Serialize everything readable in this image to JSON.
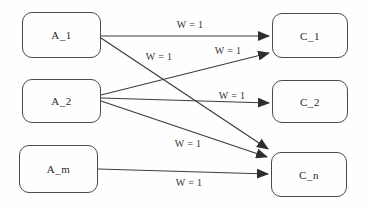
{
  "diagram": {
    "type": "weighted-bipartite-graph",
    "colors": {
      "background": "#fefefe",
      "node_border": "#4a4a4a",
      "edge_line": "#3c3c3c",
      "arrowhead": "#2e2e2e",
      "text": "#2b2b2b"
    },
    "nodes": [
      {
        "id": "A_1",
        "label": "A_1",
        "x": 22,
        "y": 12,
        "w": 79,
        "h": 46
      },
      {
        "id": "A_2",
        "label": "A_2",
        "x": 22,
        "y": 79,
        "w": 79,
        "h": 44
      },
      {
        "id": "A_m",
        "label": "A_m",
        "x": 19,
        "y": 145,
        "w": 79,
        "h": 48
      },
      {
        "id": "C_1",
        "label": "C_1",
        "x": 272,
        "y": 13,
        "w": 76,
        "h": 45
      },
      {
        "id": "C_2",
        "label": "C_2",
        "x": 272,
        "y": 80,
        "w": 76,
        "h": 43
      },
      {
        "id": "C_n",
        "label": "C_n",
        "x": 271,
        "y": 152,
        "w": 76,
        "h": 45
      }
    ],
    "edges": [
      {
        "from": "A_1",
        "to": "C_1",
        "label": "W = 1",
        "x1": 101,
        "y1": 36,
        "x2": 269,
        "y2": 36,
        "lx": 190,
        "ly": 25
      },
      {
        "from": "A_1",
        "to": "C_n",
        "label": "W = 1",
        "x1": 101,
        "y1": 38,
        "x2": 268,
        "y2": 149,
        "lx": 159,
        "ly": 57
      },
      {
        "from": "A_2",
        "to": "C_1",
        "label": "W = 1",
        "x1": 101,
        "y1": 95,
        "x2": 269,
        "y2": 53,
        "lx": 228,
        "ly": 51
      },
      {
        "from": "A_2",
        "to": "C_2",
        "label": "W = 1",
        "x1": 101,
        "y1": 98,
        "x2": 269,
        "y2": 103,
        "lx": 232,
        "ly": 96
      },
      {
        "from": "A_2",
        "to": "C_n",
        "label": "W = 1",
        "x1": 101,
        "y1": 101,
        "x2": 267,
        "y2": 157,
        "lx": 188,
        "ly": 144
      },
      {
        "from": "A_m",
        "to": "C_n",
        "label": "W = 1",
        "x1": 98,
        "y1": 169,
        "x2": 268,
        "y2": 174,
        "lx": 189,
        "ly": 183
      }
    ]
  }
}
